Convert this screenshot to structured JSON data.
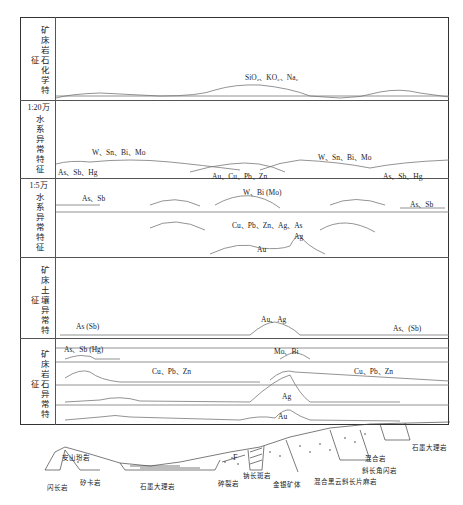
{
  "rows": [
    {
      "label": "矿床岩石化学特征",
      "scale": ""
    },
    {
      "label": "水系异常特征",
      "scale": "1:20万"
    },
    {
      "label": "水系异常特征",
      "scale": "1:5万"
    },
    {
      "label": "矿床土壤异常特征",
      "scale": ""
    },
    {
      "label": "矿床岩石异常特征",
      "scale": ""
    }
  ],
  "annotations": {
    "r1_major": "SiO₂、KO₂、Na₂",
    "r2_wsn_left": "W、Sn、Bi、Mo",
    "r2_assbhg_left": "As、Sb、Hg",
    "r2_aucu": "Au、Cu、Pb、Zn",
    "r2_wsn_right": "W、Sn、Bi、Mo",
    "r2_assbhg_right": "As、Sb、Hg",
    "r3_assb_left": "As、Sb",
    "r3_wbi": "W、Bi (Mo)",
    "r3_assb_right": "As、Sb",
    "r3_cupb": "Cu、Pb、Zn、Ag、As",
    "r3_ag": "Ag",
    "r3_au": "Au",
    "r4_as_left": "As (Sb)",
    "r4_auag": "Au、Ag",
    "r4_as_right": "As、(Sb)",
    "r5_assbhg": "As、Sb (Hg)",
    "r5_mobi": "Mo、Bi",
    "r5_cupb_left": "Cu、Pb、Zn",
    "r5_cupb_right": "Cu、Pb、Zn",
    "r5_ag": "Ag",
    "r5_au": "Au"
  },
  "cross_section": {
    "fault": "F",
    "rocks": {
      "andesite": "安山玢岩",
      "diorite": "闪长岩",
      "skarn": "矽卡岩",
      "graphite_marble": "石墨大理岩",
      "cataclasite": "碎裂岩",
      "sodic_rock": "钠长斑岩",
      "orebody": "金银矿体",
      "migmatite_gneiss": "混合黑云斜长片麻岩",
      "migmatite": "混合岩",
      "amphibolite": "斜长角闪岩",
      "graphite_marble_2": "石墨大理岩"
    }
  }
}
